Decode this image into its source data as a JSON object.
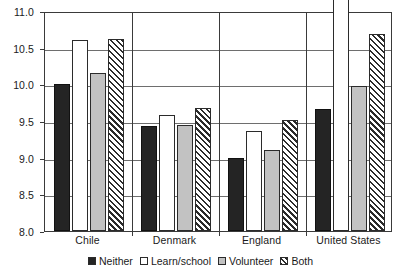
{
  "chart_data": {
    "type": "bar",
    "title": "",
    "subtitle": "",
    "xlabel": "",
    "ylabel": "",
    "ylim": [
      8.0,
      11.0
    ],
    "ytick_labels": [
      "11.0",
      "10.5",
      "10.0",
      "9.5",
      "9.0",
      "8.5",
      "8.0"
    ],
    "ytick_values": [
      11.0,
      10.5,
      10.0,
      9.5,
      9.0,
      8.5,
      8.0
    ],
    "grid": true,
    "grid_axis": "y",
    "legend_position": "bottom",
    "clipped_note": "United States 'Learn/school' bar extends above the 11.0 axis maximum",
    "categories": [
      "Chile",
      "Denmark",
      "England",
      "United States"
    ],
    "series": [
      {
        "name": "Neither",
        "fill": "solid-black",
        "color": "#242424",
        "values": [
          10.0,
          9.43,
          9.0,
          9.67
        ]
      },
      {
        "name": "Learn/school",
        "fill": "solid-white",
        "color": "#ffffff",
        "values": [
          10.6,
          9.58,
          9.37,
          11.25
        ]
      },
      {
        "name": "Volunteer",
        "fill": "solid-gray",
        "color": "#c2c2c2",
        "values": [
          10.15,
          9.45,
          9.1,
          9.98
        ]
      },
      {
        "name": "Both",
        "fill": "diagonal-hatch",
        "color": "#2b2b2b",
        "values": [
          10.62,
          9.68,
          9.52,
          10.68
        ]
      }
    ]
  }
}
